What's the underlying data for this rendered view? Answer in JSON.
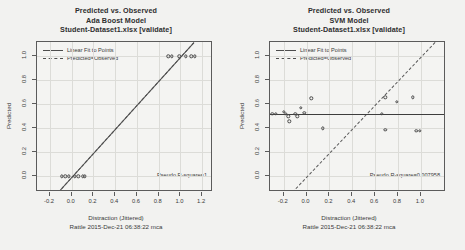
{
  "charts": [
    {
      "title_line1": "Predicted vs. Observed",
      "title_line2": "Ada Boost Model",
      "title_line3": "Student-Dataset1.xlsx [validate]",
      "legend": {
        "fit_label": "Linear Fit to Points",
        "identity_label": "Predicted=Observed"
      },
      "rsquare_label": "Pseudo R-square=1",
      "xlabel": "Distraction (Jittered)",
      "footer": "Rattle 2015-Dec-21 06:38:22 mca",
      "ylabel": "Predicted"
    },
    {
      "title_line1": "Predicted vs. Observed",
      "title_line2": "SVM Model",
      "title_line3": "Student-Dataset1.xlsx [validate]",
      "legend": {
        "fit_label": "Linear Fit to Points",
        "identity_label": "Predicted=Observed"
      },
      "rsquare_label": "Pseudo R-square=0.007958",
      "xlabel": "Distraction (Jittered)",
      "footer": "Rattle 2015-Dec-21 06:38:22 mca",
      "ylabel": "Predicted"
    }
  ],
  "chart_data": [
    {
      "type": "scatter",
      "title": "Predicted vs. Observed - Ada Boost Model - Student-Dataset1.xlsx [validate]",
      "xlabel": "Distraction (Jittered)",
      "ylabel": "Predicted",
      "xlim": [
        -0.32,
        1.3
      ],
      "ylim": [
        -0.13,
        1.12
      ],
      "xticks": [
        -0.2,
        0.0,
        0.2,
        0.4,
        0.6,
        0.8,
        1.0,
        1.2
      ],
      "xticklabels": [
        "-0.2",
        "0.0",
        "0.2",
        "0.4",
        "0.6",
        "0.8",
        "1.0",
        "1.2"
      ],
      "yticks": [
        0.0,
        0.2,
        0.4,
        0.6,
        0.8,
        1.0
      ],
      "yticklabels": [
        "0.0",
        "0.2",
        "0.4",
        "0.6",
        "0.8",
        "1.0"
      ],
      "grid": true,
      "legend_position": "top-left",
      "legend": [
        "Linear Fit to Points",
        "Predicted=Observed"
      ],
      "annotation": "Pseudo R-square=1",
      "points": [
        {
          "x": -0.09,
          "y": 0.0
        },
        {
          "x": -0.06,
          "y": 0.0
        },
        {
          "x": -0.03,
          "y": 0.0
        },
        {
          "x": 0.03,
          "y": 0.0
        },
        {
          "x": 0.06,
          "y": 0.0
        },
        {
          "x": 0.1,
          "y": 0.0
        },
        {
          "x": 0.12,
          "y": 0.0
        },
        {
          "x": 0.89,
          "y": 1.0
        },
        {
          "x": 0.92,
          "y": 1.0
        },
        {
          "x": 0.99,
          "y": 1.0
        },
        {
          "x": 1.05,
          "y": 1.0
        },
        {
          "x": 1.1,
          "y": 1.0
        },
        {
          "x": 1.13,
          "y": 1.0
        }
      ],
      "fit_line": {
        "style": "solid",
        "x0": -0.13,
        "y0": -0.13,
        "x1": 1.12,
        "y1": 1.12
      },
      "identity_line": {
        "style": "dashed",
        "x0": -0.13,
        "y0": -0.13,
        "x1": 1.12,
        "y1": 1.12
      }
    },
    {
      "type": "scatter",
      "title": "Predicted vs. Observed - SVM Model - Student-Dataset1.xlsx [validate]",
      "xlabel": "Distraction (Jittered)",
      "ylabel": "Predicted",
      "xlim": [
        -0.32,
        1.22
      ],
      "ylim": [
        -0.13,
        1.12
      ],
      "xticks": [
        -0.2,
        0.0,
        0.2,
        0.4,
        0.6,
        0.8,
        1.0
      ],
      "xticklabels": [
        "-0.2",
        "0.0",
        "0.2",
        "0.4",
        "0.6",
        "0.8",
        "1.0"
      ],
      "yticks": [
        0.0,
        0.2,
        0.4,
        0.6,
        0.8,
        1.0
      ],
      "yticklabels": [
        "0.0",
        "0.2",
        "0.4",
        "0.6",
        "0.8",
        "1.0"
      ],
      "grid": true,
      "legend_position": "top-left",
      "legend": [
        "Linear Fit to Points",
        "Predicted=Observed"
      ],
      "annotation": "Pseudo R-square=0.007958",
      "points": [
        {
          "x": -0.3,
          "y": 0.52
        },
        {
          "x": -0.27,
          "y": 0.52
        },
        {
          "x": -0.2,
          "y": 0.54
        },
        {
          "x": -0.18,
          "y": 0.52
        },
        {
          "x": -0.16,
          "y": 0.5
        },
        {
          "x": -0.15,
          "y": 0.46
        },
        {
          "x": -0.1,
          "y": 0.52
        },
        {
          "x": -0.08,
          "y": 0.5
        },
        {
          "x": -0.05,
          "y": 0.57
        },
        {
          "x": -0.02,
          "y": 0.53
        },
        {
          "x": 0.04,
          "y": 0.65
        },
        {
          "x": 0.14,
          "y": 0.4
        },
        {
          "x": 0.69,
          "y": 0.66
        },
        {
          "x": 0.69,
          "y": 0.39
        },
        {
          "x": 0.66,
          "y": 0.52
        },
        {
          "x": 0.79,
          "y": 0.62
        },
        {
          "x": 0.93,
          "y": 0.66
        },
        {
          "x": 0.96,
          "y": 0.38
        },
        {
          "x": 0.99,
          "y": 0.38
        }
      ],
      "fit_line": {
        "style": "solid",
        "x0": -0.32,
        "y0": 0.523,
        "x1": 1.22,
        "y1": 0.523
      },
      "identity_line": {
        "style": "dashed",
        "x0": -0.13,
        "y0": -0.13,
        "x1": 1.12,
        "y1": 1.12
      }
    }
  ]
}
